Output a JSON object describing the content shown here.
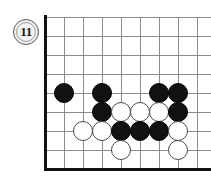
{
  "diagram": {
    "kind": "go-board-problem-diagram",
    "move_label": "11",
    "board": {
      "cell_size": 19,
      "origin_x": 45,
      "origin_y": 17,
      "columns": 9,
      "rows": 9,
      "vertical_lines_x": [
        45,
        64,
        83,
        102,
        121,
        140,
        159,
        178,
        197
      ],
      "horizontal_lines_y": [
        17,
        36,
        55,
        74,
        93,
        112,
        131,
        150,
        168
      ],
      "left_edge_x": 45,
      "bottom_edge_y": 168,
      "grid_color": "#8d8d8d",
      "edge_color": "#111111"
    },
    "stone_radius": 10,
    "stones": [
      {
        "color": "black",
        "cx": 64,
        "cy": 93
      },
      {
        "color": "black",
        "cx": 102,
        "cy": 93
      },
      {
        "color": "black",
        "cx": 159,
        "cy": 93
      },
      {
        "color": "black",
        "cx": 178,
        "cy": 93
      },
      {
        "color": "black",
        "cx": 102,
        "cy": 112
      },
      {
        "color": "white",
        "cx": 121,
        "cy": 112
      },
      {
        "color": "white",
        "cx": 140,
        "cy": 112
      },
      {
        "color": "white",
        "cx": 159,
        "cy": 112
      },
      {
        "color": "black",
        "cx": 178,
        "cy": 112
      },
      {
        "color": "white",
        "cx": 83,
        "cy": 131
      },
      {
        "color": "white",
        "cx": 102,
        "cy": 131
      },
      {
        "color": "black",
        "cx": 121,
        "cy": 131
      },
      {
        "color": "black",
        "cx": 140,
        "cy": 131
      },
      {
        "color": "black",
        "cx": 159,
        "cy": 131
      },
      {
        "color": "white",
        "cx": 178,
        "cy": 131
      },
      {
        "color": "white",
        "cx": 121,
        "cy": 150
      },
      {
        "color": "white",
        "cx": 178,
        "cy": 150
      }
    ],
    "colors": {
      "black_stone": "#111111",
      "white_stone": "#ffffff",
      "white_stone_outline": "#4a4a4a",
      "grid": "#8d8d8d",
      "edge": "#111111",
      "badge_fill": "#f2f2f2",
      "badge_outline": "#5a5a5a",
      "background": "#ffffff"
    },
    "badge_position": {
      "cx": 26,
      "cy": 32
    }
  }
}
